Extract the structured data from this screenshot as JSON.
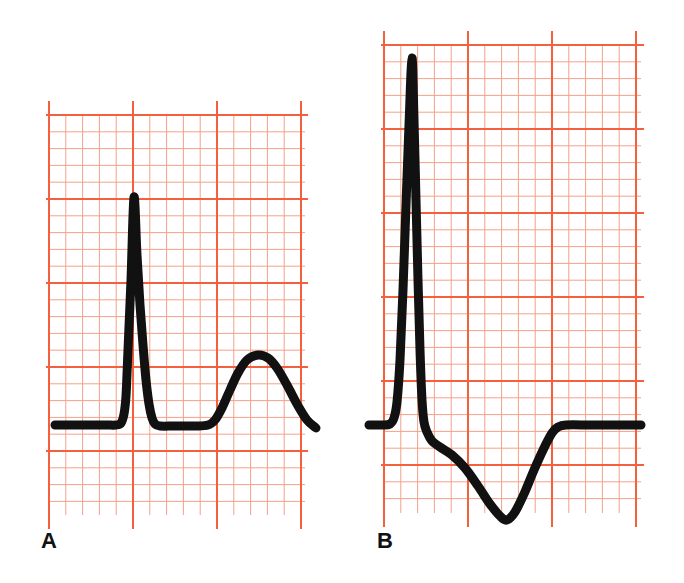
{
  "figure": {
    "background_color": "#ffffff",
    "width": 684,
    "height": 583
  },
  "grid": {
    "major_color": "#f4603c",
    "minor_color": "#f3a189",
    "major_line_width": 2.0,
    "minor_line_width": 1.0,
    "minor_cell_px": 16.8,
    "major_cell_px": 84,
    "description": "ECG graph paper: small squares with every 5th line bold"
  },
  "trace": {
    "color": "#111111",
    "line_width": 9
  },
  "panels": [
    {
      "id": "A",
      "label": "A",
      "label_x": 41,
      "label_y": 530,
      "grid_box": {
        "x": 49,
        "y": 115,
        "width": 256,
        "height": 400
      },
      "baseline_y": 425,
      "waveform_name": "normal-ecg-complex",
      "features": [
        {
          "name": "isoelectric-baseline-left",
          "x_start": 55,
          "x_end": 118,
          "y": 425
        },
        {
          "name": "r-wave-peak",
          "x": 134,
          "y": 196,
          "amplitude_px": 229
        },
        {
          "name": "qrs-return-to-baseline",
          "x": 158,
          "y": 425
        },
        {
          "name": "st-segment",
          "x_start": 158,
          "x_end": 206,
          "y": 425
        },
        {
          "name": "t-wave-peak",
          "x": 258,
          "y": 355,
          "amplitude_px": 70
        },
        {
          "name": "trace-end",
          "x": 316,
          "y": 428
        }
      ]
    },
    {
      "id": "B",
      "label": "B",
      "label_x": 377,
      "label_y": 530,
      "grid_box": {
        "x": 384,
        "y": 45,
        "width": 257,
        "height": 468
      },
      "baseline_y": 425,
      "waveform_name": "ecg-complex-with-deep-s-wave",
      "features": [
        {
          "name": "isoelectric-baseline-left",
          "x_start": 369,
          "x_end": 392,
          "y": 425
        },
        {
          "name": "r-wave-peak",
          "x": 412,
          "y": 57,
          "amplitude_px": 368
        },
        {
          "name": "qrs-downstroke-shoulder",
          "x": 424,
          "y": 425
        },
        {
          "name": "st-segment-depressed",
          "x_start": 430,
          "x_end": 470,
          "y": 446
        },
        {
          "name": "s-wave-trough",
          "x": 505,
          "y": 519,
          "depth_px": 94
        },
        {
          "name": "return-to-baseline",
          "x": 562,
          "y": 425
        },
        {
          "name": "isoelectric-baseline-right",
          "x_start": 562,
          "x_end": 641,
          "y": 425
        }
      ]
    }
  ],
  "chart_data": {
    "type": "line",
    "xlabel": "",
    "ylabel": "",
    "grid": true,
    "legend_position": "none",
    "series": [
      {
        "name": "A",
        "label": "A",
        "color": "#111111",
        "points": [
          [
            55,
            425
          ],
          [
            80,
            425
          ],
          [
            105,
            425
          ],
          [
            116,
            425
          ],
          [
            121,
            423
          ],
          [
            124,
            414
          ],
          [
            126,
            396
          ],
          [
            128,
            350
          ],
          [
            131,
            280
          ],
          [
            134,
            197
          ],
          [
            137,
            255
          ],
          [
            140,
            305
          ],
          [
            143,
            345
          ],
          [
            146,
            380
          ],
          [
            149,
            404
          ],
          [
            152,
            418
          ],
          [
            155,
            424
          ],
          [
            160,
            426
          ],
          [
            175,
            426
          ],
          [
            195,
            426
          ],
          [
            208,
            425
          ],
          [
            215,
            420
          ],
          [
            222,
            408
          ],
          [
            230,
            390
          ],
          [
            238,
            373
          ],
          [
            247,
            360
          ],
          [
            258,
            355
          ],
          [
            268,
            358
          ],
          [
            277,
            368
          ],
          [
            287,
            385
          ],
          [
            297,
            404
          ],
          [
            307,
            420
          ],
          [
            316,
            428
          ]
        ]
      },
      {
        "name": "B",
        "label": "B",
        "color": "#111111",
        "points": [
          [
            369,
            425
          ],
          [
            382,
            425
          ],
          [
            390,
            424
          ],
          [
            394,
            418
          ],
          [
            397,
            402
          ],
          [
            400,
            360
          ],
          [
            403,
            290
          ],
          [
            406,
            205
          ],
          [
            409,
            125
          ],
          [
            412,
            58
          ],
          [
            414,
            120
          ],
          [
            416,
            200
          ],
          [
            418,
            280
          ],
          [
            420,
            350
          ],
          [
            422,
            400
          ],
          [
            424,
            422
          ],
          [
            427,
            432
          ],
          [
            432,
            441
          ],
          [
            440,
            447
          ],
          [
            452,
            455
          ],
          [
            465,
            468
          ],
          [
            478,
            486
          ],
          [
            490,
            504
          ],
          [
            500,
            516
          ],
          [
            507,
            520
          ],
          [
            515,
            512
          ],
          [
            524,
            494
          ],
          [
            534,
            470
          ],
          [
            544,
            448
          ],
          [
            552,
            433
          ],
          [
            558,
            427
          ],
          [
            566,
            425
          ],
          [
            590,
            425
          ],
          [
            615,
            425
          ],
          [
            641,
            425
          ]
        ]
      }
    ]
  }
}
